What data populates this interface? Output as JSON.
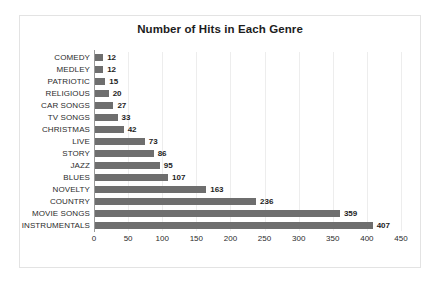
{
  "chart_data": {
    "type": "bar",
    "orientation": "horizontal",
    "title": "Number of Hits in Each Genre",
    "xlabel": "",
    "ylabel": "",
    "xlim": [
      0,
      450
    ],
    "xticks": [
      0,
      50,
      100,
      150,
      200,
      250,
      300,
      350,
      400,
      450
    ],
    "grid": true,
    "legend": false,
    "bar_color": "#6e6e6e",
    "categories": [
      "COMEDY",
      "MEDLEY",
      "PATRIOTIC",
      "RELIGIOUS",
      "CAR SONGS",
      "TV SONGS",
      "CHRISTMAS",
      "LIVE",
      "STORY",
      "JAZZ",
      "BLUES",
      "NOVELTY",
      "COUNTRY",
      "MOVIE SONGS",
      "INSTRUMENTALS"
    ],
    "values": [
      12,
      12,
      15,
      20,
      27,
      33,
      42,
      73,
      86,
      95,
      107,
      163,
      236,
      359,
      407
    ],
    "data_labels": [
      "12",
      "12",
      "15",
      "20",
      "27",
      "33",
      "42",
      "73",
      "86",
      "95",
      "107",
      "163",
      "236",
      "359",
      "407"
    ]
  }
}
